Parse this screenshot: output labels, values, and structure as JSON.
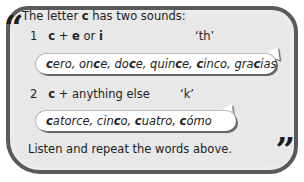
{
  "quotes": {
    "open": "“",
    "close": "”"
  },
  "intro": {
    "pre": "The letter ",
    "letter": "c",
    "post": " has two sounds:"
  },
  "rule1": {
    "number": "1",
    "c": "c",
    "plus": " + ",
    "e": "e",
    "or": " or ",
    "i": "i",
    "sound": "‘th’",
    "words": [
      {
        "b": "c",
        "r": "ero, "
      },
      {
        "r": "on",
        "b": "c",
        "r2": "e, "
      },
      {
        "r": "do",
        "b": "c",
        "r2": "e, "
      },
      {
        "r": "quin",
        "b": "c",
        "r2": "e, "
      },
      {
        "b": "c",
        "r": "inco, "
      },
      {
        "r": "gra",
        "b": "c",
        "r2": "ias"
      }
    ]
  },
  "rule2": {
    "number": "2",
    "c": "c",
    "rest": " + anything else",
    "sound": "‘k’",
    "words": [
      {
        "b": "c",
        "r": "atorce, "
      },
      {
        "r": "cin",
        "b": "c",
        "r2": "o, "
      },
      {
        "b": "c",
        "r": "uatro, "
      },
      {
        "b": "c",
        "r": "ómo"
      }
    ]
  },
  "instruction": "Listen and repeat the words above."
}
